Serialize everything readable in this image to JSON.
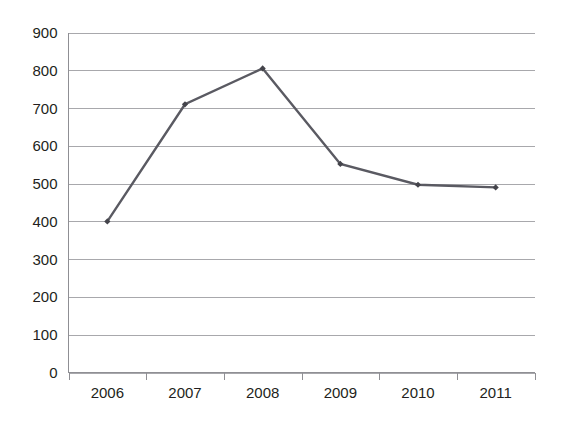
{
  "chart_data": {
    "type": "line",
    "title": "",
    "subtitle": "",
    "xlabel": "",
    "ylabel": "",
    "categories": [
      "2006",
      "2007",
      "2008",
      "2009",
      "2010",
      "2011"
    ],
    "values": [
      400,
      710,
      805,
      552,
      497,
      490
    ],
    "series": [
      {
        "name": "",
        "values": [
          400,
          710,
          805,
          552,
          497,
          490
        ]
      }
    ],
    "ylim": [
      0,
      900
    ],
    "ytick_step": 100,
    "ytick_labels": [
      "0",
      "100",
      "200",
      "300",
      "400",
      "500",
      "600",
      "700",
      "800",
      "900"
    ],
    "ytick_values": [
      0,
      100,
      200,
      300,
      400,
      500,
      600,
      700,
      800,
      900
    ],
    "grid": "horizontal",
    "legend": "none",
    "annotations": [],
    "colors": {
      "series_line": "#5a5a62",
      "marker": "#44444b",
      "gridline": "#a8a8ac",
      "axis": "#8f8f94",
      "tick_text": "#231f20",
      "background": "#ffffff"
    }
  }
}
